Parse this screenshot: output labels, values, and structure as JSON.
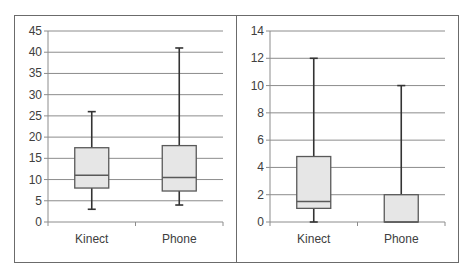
{
  "chart_data": [
    {
      "type": "box",
      "title": "",
      "xlabel": "",
      "ylabel": "",
      "categories": [
        "Kinect",
        "Phone"
      ],
      "ylim": [
        0,
        45
      ],
      "yticks": [
        0,
        5,
        10,
        15,
        20,
        25,
        30,
        35,
        40,
        45
      ],
      "grid": true,
      "series": [
        {
          "name": "Kinect",
          "min": 3,
          "q1": 8,
          "median": 11,
          "q3": 17.5,
          "max": 26
        },
        {
          "name": "Phone",
          "min": 4,
          "q1": 7.3,
          "median": 10.5,
          "q3": 18,
          "max": 41
        }
      ]
    },
    {
      "type": "box",
      "title": "",
      "xlabel": "",
      "ylabel": "",
      "categories": [
        "Kinect",
        "Phone"
      ],
      "ylim": [
        0,
        14
      ],
      "yticks": [
        0,
        2,
        4,
        6,
        8,
        10,
        12,
        14
      ],
      "grid": true,
      "series": [
        {
          "name": "Kinect",
          "min": 0,
          "q1": 1,
          "median": 1.5,
          "q3": 4.8,
          "max": 12
        },
        {
          "name": "Phone",
          "min": 0,
          "q1": 0,
          "median": 0,
          "q3": 2,
          "max": 10
        }
      ]
    }
  ],
  "colors": {
    "box_fill": "#e6e6e6",
    "box_stroke": "#595959",
    "whisker": "#333333",
    "grid": "#8c8c8c",
    "axis": "#8c8c8c",
    "text": "#404040"
  }
}
